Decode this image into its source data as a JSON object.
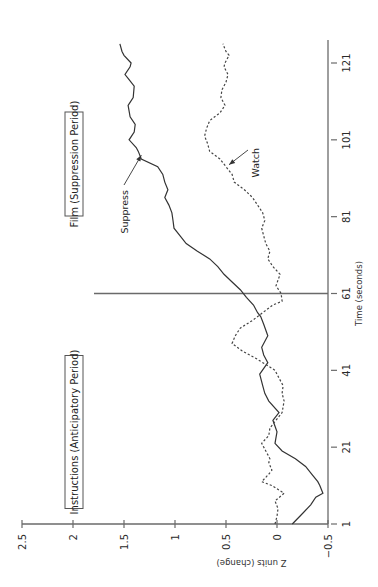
{
  "chart_data": {
    "type": "line",
    "orientation": "rotated-90-ccw",
    "title": "",
    "xlabel": "Time (seconds)",
    "ylabel": "Z units (change)",
    "xlim": [
      1,
      127
    ],
    "ylim": [
      -0.5,
      2.5
    ],
    "xticks": [
      1,
      21,
      41,
      61,
      81,
      101,
      121
    ],
    "xtick_labels": [
      "1",
      "21",
      "41",
      "61",
      "81",
      "101",
      "121"
    ],
    "yticks": [
      -0.5,
      0,
      0.5,
      1,
      1.5,
      2,
      2.5
    ],
    "ytick_labels": [
      "−0.5",
      "0",
      "0.5",
      "1",
      "1.5",
      "2",
      "2.5"
    ],
    "grid": false,
    "vertical_marker": {
      "x": 61,
      "label": ""
    },
    "period_labels": [
      {
        "text": "Instructions (Anticipatory Period)",
        "position": "first-half"
      },
      {
        "text": "Film (Suppression Period)",
        "position": "second-half"
      }
    ],
    "series": [
      {
        "name": "Suppress",
        "style": "solid",
        "x": [
          1,
          4,
          6,
          8,
          9,
          11,
          12,
          14,
          16,
          18,
          20,
          22,
          25,
          28,
          30,
          33,
          35,
          37,
          40,
          43,
          45,
          47,
          50,
          53,
          55,
          56,
          58,
          60,
          62,
          64,
          66,
          68,
          70,
          72,
          74,
          76,
          78,
          80,
          82,
          84,
          86,
          88,
          90,
          92,
          94,
          96,
          98,
          99,
          101,
          103,
          105,
          107,
          110,
          112,
          115,
          117,
          118,
          120,
          121,
          123,
          124,
          126
        ],
        "values": [
          -0.15,
          -0.26,
          -0.33,
          -0.38,
          -0.45,
          -0.42,
          -0.4,
          -0.34,
          -0.28,
          -0.18,
          -0.05,
          0.02,
          0.0,
          0.04,
          -0.02,
          0.08,
          0.12,
          0.14,
          0.17,
          0.09,
          0.13,
          0.15,
          0.09,
          0.13,
          0.16,
          0.19,
          0.23,
          0.3,
          0.36,
          0.44,
          0.52,
          0.58,
          0.66,
          0.78,
          0.89,
          0.95,
          1.01,
          1.02,
          1.03,
          1.06,
          1.1,
          1.07,
          1.1,
          1.12,
          1.17,
          1.33,
          1.36,
          1.38,
          1.45,
          1.4,
          1.39,
          1.44,
          1.46,
          1.41,
          1.4,
          1.46,
          1.49,
          1.44,
          1.43,
          1.5,
          1.52,
          1.54
        ]
      },
      {
        "name": "Watch",
        "style": "dashed",
        "x": [
          1,
          3,
          5,
          7,
          9,
          11,
          12,
          14,
          15,
          17,
          18,
          20,
          22,
          24,
          26,
          28,
          30,
          33,
          35,
          37,
          39,
          41,
          44,
          46,
          48,
          50,
          52,
          54,
          56,
          58,
          59,
          61,
          63,
          66,
          68,
          70,
          72,
          74,
          76,
          78,
          80,
          82,
          84,
          86,
          88,
          90,
          92,
          94,
          96,
          98,
          100,
          102,
          104,
          106,
          108,
          110,
          112,
          114,
          116,
          118,
          120,
          121,
          123,
          124,
          126
        ],
        "values": [
          0.02,
          0.0,
          -0.01,
          0.02,
          -0.07,
          0.05,
          0.15,
          0.08,
          0.05,
          0.08,
          0.07,
          0.11,
          0.15,
          0.08,
          0.07,
          0.01,
          -0.05,
          -0.07,
          -0.05,
          -0.06,
          -0.02,
          0.02,
          0.2,
          0.34,
          0.44,
          0.41,
          0.36,
          0.24,
          0.14,
          0.04,
          -0.05,
          -0.04,
          0.01,
          -0.03,
          0.04,
          0.09,
          0.07,
          0.11,
          0.13,
          0.15,
          0.12,
          0.14,
          0.19,
          0.24,
          0.32,
          0.42,
          0.44,
          0.5,
          0.56,
          0.66,
          0.68,
          0.71,
          0.69,
          0.66,
          0.56,
          0.51,
          0.55,
          0.54,
          0.5,
          0.48,
          0.52,
          0.51,
          0.47,
          0.5,
          0.53
        ]
      }
    ],
    "annotations": [
      {
        "text": "Suppress",
        "target_series": "Suppress",
        "x": 97,
        "value": 1.34,
        "arrow": true
      },
      {
        "text": "Watch",
        "target_series": "Watch",
        "x": 94,
        "value": 0.5,
        "arrow": true
      }
    ]
  }
}
